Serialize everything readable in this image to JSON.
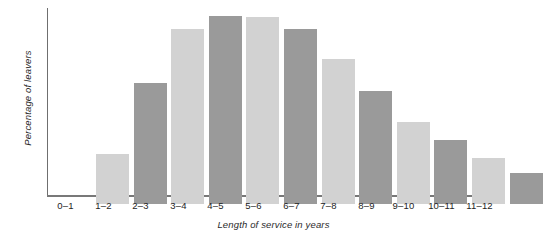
{
  "chart_data": {
    "type": "bar",
    "title": "",
    "subtitle": "",
    "xlabel": "Length of service in years",
    "ylabel": "Percentage of leavers",
    "categories": [
      "0–1",
      "1–2",
      "2–3",
      "3–4",
      "4–5",
      "5–6",
      "6–7",
      "7–8",
      "8–9",
      "9–10",
      "10–11",
      "11–12"
    ],
    "values": [
      3.7,
      9.0,
      13.0,
      14.0,
      13.9,
      13.0,
      10.8,
      8.4,
      6.1,
      4.8,
      3.4,
      2.3
    ],
    "ylim": [
      0,
      14.0
    ],
    "xlim": null,
    "grid": false,
    "legend": null,
    "legend_position": "none",
    "yticks": [],
    "bar_colors": [
      "#d2d2d2",
      "#9a9a9a",
      "#d2d2d2",
      "#9a9a9a",
      "#d2d2d2",
      "#9a9a9a",
      "#d2d2d2",
      "#9a9a9a",
      "#d2d2d2",
      "#9a9a9a",
      "#d2d2d2",
      "#9a9a9a"
    ],
    "annotations": []
  },
  "style": {
    "background": "#ffffff",
    "axis_color": "#787878",
    "text_color": "#242424",
    "light_bar": "#d2d2d2",
    "dark_bar": "#9a9a9a"
  }
}
